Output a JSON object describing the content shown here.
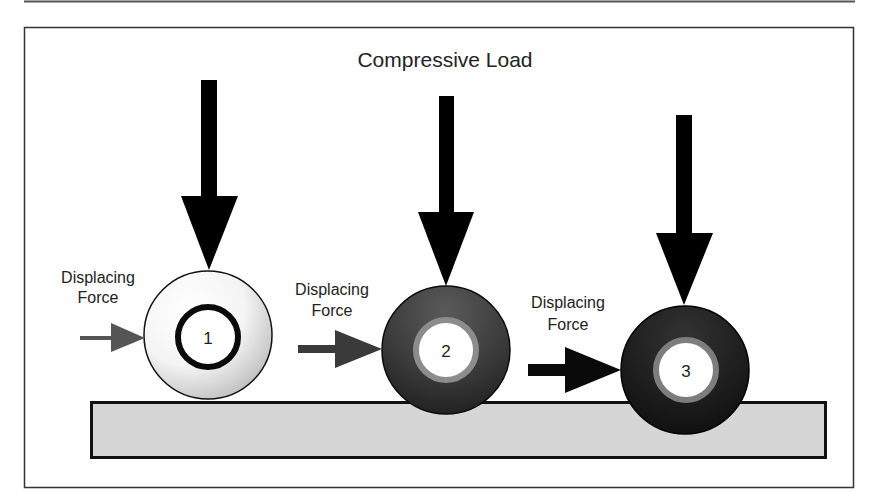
{
  "diagram": {
    "title": "Compressive Load",
    "colors": {
      "frame": "#333333",
      "bar_fill": "#d6d6d6",
      "bar_border": "#111111",
      "load_arrow": "#000000",
      "text": "#222222"
    },
    "stages": [
      {
        "number": "1",
        "label_line1": "Displacing",
        "label_line2": "Force",
        "outer_fill": "light",
        "inner_ring": "black",
        "push_arrow_color": "#555555"
      },
      {
        "number": "2",
        "label_line1": "Displacing",
        "label_line2": "Force",
        "outer_fill": "dark",
        "inner_ring": "gray",
        "push_arrow_color": "#3a3a3a"
      },
      {
        "number": "3",
        "label_line1": "Displacing",
        "label_line2": "Force",
        "outer_fill": "darkest",
        "inner_ring": "gray",
        "push_arrow_color": "#0a0a0a"
      }
    ]
  }
}
